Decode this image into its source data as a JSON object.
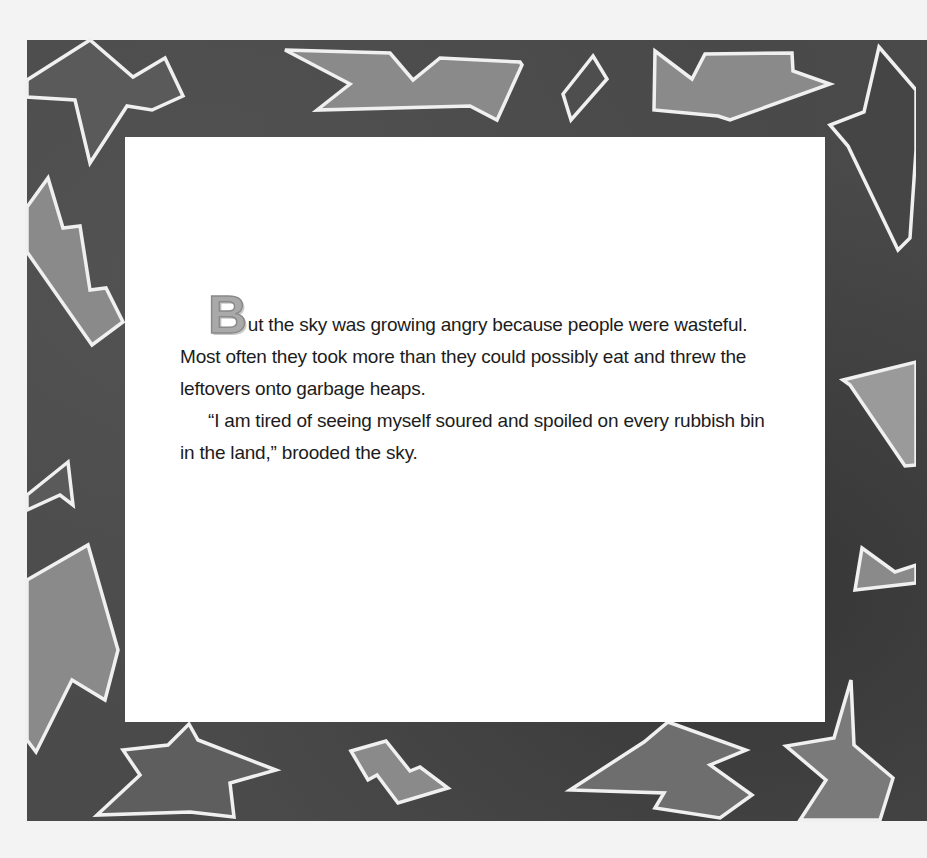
{
  "page": {
    "type": "picture-book-page",
    "colors": {
      "background": "#f3f3f3",
      "frame": "#4a4a4a",
      "shape_fill": "#8c8c8c",
      "shape_outline": "#f2f2f2",
      "panel": "#ffffff",
      "text": "#1c1c1c",
      "dropcap": "#a9a9a9"
    }
  },
  "story": {
    "dropcap": "B",
    "paragraphs": [
      {
        "first_rest": "ut the sky was growing angry because people were wasteful.",
        "lines": [
          "Most often they took more than they could possibly eat and threw the",
          "leftovers onto garbage heaps."
        ]
      },
      {
        "lines": [
          "“I am tired of seeing myself soured and spoiled on every rubbish bin",
          "in the land,” brooded the sky."
        ]
      }
    ]
  },
  "decoration": {
    "frame_shapes": [
      "star-shape-top-left",
      "arrow-shape-top",
      "diamond-shape-top",
      "fish-shape-top",
      "star-shape-top-right",
      "bolt-shape-left",
      "triangle-shape-left",
      "jagged-shape-left-bottom",
      "star-shape-bottom-left",
      "z-shape-bottom",
      "arrow-shape-bottom",
      "star-shape-bottom-right",
      "kite-shape-right",
      "triangle-shape-right"
    ]
  }
}
